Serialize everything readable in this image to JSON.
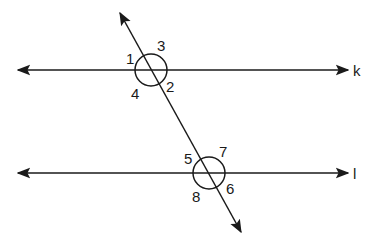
{
  "diagram": {
    "type": "parallel-lines-transversal",
    "lines": [
      {
        "name": "k",
        "label": "k"
      },
      {
        "name": "l",
        "label": "l"
      }
    ],
    "angles": {
      "a1": "1",
      "a2": "2",
      "a3": "3",
      "a4": "4",
      "a5": "5",
      "a6": "6",
      "a7": "7",
      "a8": "8"
    },
    "colors": {
      "stroke": "#1a1a1a",
      "background": "#ffffff"
    }
  }
}
